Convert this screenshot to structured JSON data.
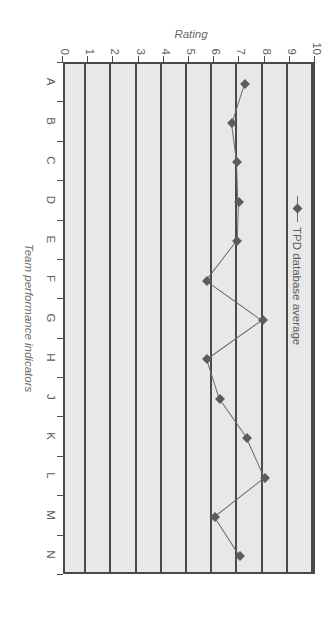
{
  "chart_data": {
    "type": "line",
    "title": "",
    "xlabel": "Team performance indicators",
    "ylabel": "Rating",
    "categories": [
      "A",
      "B",
      "C",
      "D",
      "E",
      "F",
      "G",
      "H",
      "J",
      "K",
      "L",
      "M",
      "N"
    ],
    "series": [
      {
        "name": "TPD database average",
        "values": [
          7.3,
          6.8,
          7.0,
          7.05,
          7.0,
          5.8,
          8.0,
          5.8,
          6.3,
          7.4,
          8.1,
          6.1,
          7.1
        ]
      }
    ],
    "yticks": [
      "0",
      "1",
      "2",
      "3",
      "4",
      "5",
      "6",
      "7",
      "8",
      "9",
      "10"
    ],
    "ylim": [
      0,
      10
    ],
    "grid": "horizontal",
    "legend_position": "top-right",
    "marker": "diamond",
    "colors": {
      "line": "#6b6b6b",
      "marker": "#5c5c5c",
      "plot_background": "#e8e8e8",
      "axis": "#4a4a4a",
      "text": "#5e5e5e"
    }
  },
  "legend": {
    "entries": [
      {
        "label": "TPD database average"
      }
    ]
  }
}
